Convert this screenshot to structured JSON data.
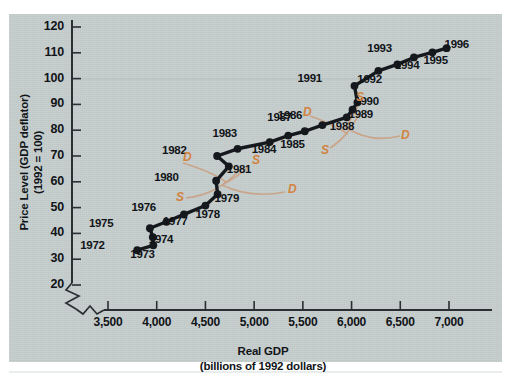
{
  "chart_data": {
    "type": "scatter",
    "title": "",
    "xlabel": "Real GDP",
    "xlabel_sub": "(billions of 1992 dollars)",
    "ylabel": "Price Level (GDP deflator)",
    "ylabel_sub": "(1992 = 100)",
    "xlim": [
      3350,
      7150
    ],
    "ylim": [
      15,
      125
    ],
    "xticks": [
      "3,500",
      "4,000",
      "4,500",
      "5,000",
      "5,500",
      "6,000",
      "6,500",
      "7,000"
    ],
    "xtick_values": [
      3500,
      4000,
      4500,
      5000,
      5500,
      6000,
      6500,
      7000
    ],
    "yticks": [
      "20",
      "30",
      "40",
      "50",
      "60",
      "70",
      "80",
      "90",
      "100",
      "110",
      "120"
    ],
    "ytick_values": [
      20,
      30,
      40,
      50,
      60,
      70,
      80,
      90,
      100,
      110,
      120
    ],
    "axis_break_x": true,
    "axis_break_y": true,
    "grid": false,
    "legend": "none",
    "series": [
      {
        "name": "Real GDP and Price Level, 1972-1996",
        "point_color": "#15191d",
        "line_color": "#15191d",
        "points": [
          {
            "label": "1972",
            "x": 3800,
            "y": 33.5,
            "lx": -44,
            "ly": -5
          },
          {
            "label": "1973",
            "x": 3965,
            "y": 35.4,
            "lx": -10,
            "ly": 9
          },
          {
            "label": "1974",
            "x": 3960,
            "y": 38.5,
            "lx": 9,
            "ly": 2
          },
          {
            "label": "1975",
            "x": 3930,
            "y": 42.0,
            "lx": -48,
            "ly": -5
          },
          {
            "label": "1976",
            "x": 4100,
            "y": 44.5,
            "lx": -22,
            "ly": -15
          },
          {
            "label": "1977",
            "x": 4280,
            "y": 47.4,
            "lx": -8,
            "ly": 7
          },
          {
            "label": "1978",
            "x": 4500,
            "y": 50.8,
            "lx": 3,
            "ly": 8
          },
          {
            "label": "1979",
            "x": 4625,
            "y": 55.2,
            "lx": 10,
            "ly": 4
          },
          {
            "label": "1980",
            "x": 4610,
            "y": 60.4,
            "lx": -49,
            "ly": -4
          },
          {
            "label": "1981",
            "x": 4740,
            "y": 66.0,
            "lx": 11,
            "ly": 3
          },
          {
            "label": "1982",
            "x": 4620,
            "y": 70.0,
            "lx": -42,
            "ly": -6
          },
          {
            "label": "1983",
            "x": 4830,
            "y": 72.8,
            "lx": -12,
            "ly": -16
          },
          {
            "label": "1984",
            "x": 5160,
            "y": 75.4,
            "lx": -5,
            "ly": 7
          },
          {
            "label": "1985",
            "x": 5350,
            "y": 77.9,
            "lx": 5,
            "ly": 8
          },
          {
            "label": "1986",
            "x": 5520,
            "y": 79.6,
            "lx": -14,
            "ly": -16
          },
          {
            "label": "1987",
            "x": 5700,
            "y": 82.0,
            "lx": -42,
            "ly": -8
          },
          {
            "label": "1988",
            "x": 5950,
            "y": 85.0,
            "lx": -4,
            "ly": 9
          },
          {
            "label": "1989",
            "x": 6010,
            "y": 88.0,
            "lx": 9,
            "ly": 4
          },
          {
            "label": "1990",
            "x": 6060,
            "y": 90.8,
            "lx": 10,
            "ly": -1
          },
          {
            "label": "1991",
            "x": 6030,
            "y": 97.2,
            "lx": -44,
            "ly": -8
          },
          {
            "label": "1992",
            "x": 6275,
            "y": 103.0,
            "lx": -8,
            "ly": 8
          },
          {
            "label": "1993",
            "x": 6470,
            "y": 105.5,
            "lx": -17,
            "ly": -16
          },
          {
            "label": "1994",
            "x": 6640,
            "y": 108.2,
            "lx": -6,
            "ly": 8
          },
          {
            "label": "1995",
            "x": 6830,
            "y": 110.2,
            "lx": 4,
            "ly": 8
          },
          {
            "label": "1996",
            "x": 6975,
            "y": 111.8,
            "lx": 11,
            "ly": -4
          }
        ]
      }
    ],
    "annotations": {
      "color": "#d2833f",
      "curves": [
        {
          "name": "demand-curve-1980",
          "letter": "D",
          "letter_x": 183,
          "letter_y": 150,
          "path": "M 183,163 C 196,167 214,173 226,182"
        },
        {
          "name": "supply-curve-1980",
          "letter": "S",
          "letter_x": 176,
          "letter_y": 190,
          "path": "M 186,198 C 206,196 222,188 240,170"
        },
        {
          "name": "supply-curve-1981",
          "letter": "S",
          "letter_x": 252,
          "letter_y": 153,
          "path": "M 249,166 C 241,174 232,180 222,185"
        },
        {
          "name": "demand-curve-1981",
          "letter": "D",
          "letter_x": 288,
          "letter_y": 182,
          "path": "M 222,185 C 245,196 265,196 285,192"
        },
        {
          "name": "demand-curve-1988",
          "letter": "D",
          "letter_x": 303,
          "letter_y": 105,
          "path": "M 310,116 C 322,120 335,126 348,134"
        },
        {
          "name": "supply-curve-1988",
          "letter": "S",
          "letter_x": 321,
          "letter_y": 143,
          "path": "M 330,148 C 340,142 350,132 360,112"
        },
        {
          "name": "supply-curve-1991",
          "letter": "S",
          "letter_x": 356,
          "letter_y": 90,
          "path": "M 360,100 C 356,112 351,120 345,127"
        },
        {
          "name": "demand-curve-1991",
          "letter": "D",
          "letter_x": 401,
          "letter_y": 128,
          "path": "M 345,127 C 365,140 385,140 400,136"
        }
      ]
    }
  }
}
